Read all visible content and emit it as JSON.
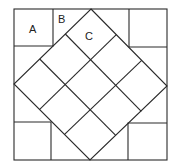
{
  "diagram": {
    "labels": [
      {
        "id": "A",
        "text": "A",
        "x": 33,
        "y": 32
      },
      {
        "id": "B",
        "text": "B",
        "x": 60,
        "y": 22
      },
      {
        "id": "C",
        "text": "C",
        "x": 86,
        "y": 39
      }
    ],
    "outer_square": {
      "x1": 14,
      "y1": 9,
      "x2": 167,
      "y2": 160
    },
    "diamond": {
      "top": [
        91,
        9
      ],
      "right": [
        167,
        86
      ],
      "bottom": [
        90,
        160
      ],
      "left": [
        14,
        84
      ],
      "divisions": 3
    },
    "corner_squares": [
      {
        "name": "top-left",
        "x1": 14,
        "y1": 9,
        "x2": 53,
        "y2": 46
      },
      {
        "name": "top-right",
        "x1": 129,
        "y1": 9,
        "x2": 167,
        "y2": 47
      },
      {
        "name": "bottom-left",
        "x1": 14,
        "y1": 122,
        "x2": 51,
        "y2": 160
      },
      {
        "name": "bottom-right",
        "x1": 128,
        "y1": 123,
        "x2": 167,
        "y2": 160
      }
    ],
    "stroke_color": "#2a2a2a",
    "background": "#ffffff"
  }
}
